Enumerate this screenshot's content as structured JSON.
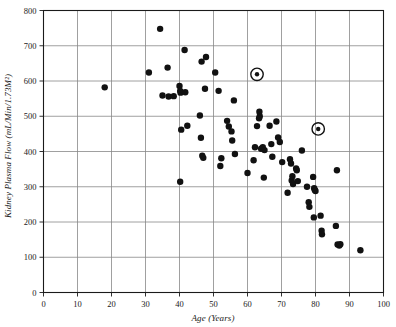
{
  "chart_data": {
    "type": "scatter",
    "title": "",
    "xlabel": "Age (Years)",
    "ylabel": "Kidney Plasma Flow (mL/Min/1.73M²)",
    "xlim": [
      0,
      100
    ],
    "ylim": [
      0,
      800
    ],
    "xticks": [
      0,
      10,
      20,
      30,
      40,
      50,
      60,
      70,
      80,
      90,
      100
    ],
    "yticks": [
      0,
      100,
      200,
      300,
      400,
      500,
      600,
      700,
      800
    ],
    "xtick_labels": [
      "0",
      "10",
      "20",
      "30",
      "40",
      "50",
      "60",
      "70",
      "80",
      "90",
      "100"
    ],
    "ytick_labels": [
      "0",
      "100",
      "200",
      "300",
      "400",
      "500",
      "600",
      "700",
      "800"
    ],
    "grid": true,
    "grid_color": "#888888",
    "legend": null,
    "marker_color": "#111111",
    "marker_size": 3.2,
    "series": [
      {
        "name": "Subjects",
        "points": [
          [
            18.0,
            582
          ],
          [
            31.0,
            624
          ],
          [
            34.3,
            748
          ],
          [
            35.0,
            559
          ],
          [
            36.5,
            638
          ],
          [
            36.8,
            556
          ],
          [
            38.3,
            557
          ],
          [
            40.0,
            586
          ],
          [
            40.2,
            572
          ],
          [
            40.3,
            567
          ],
          [
            40.5,
            462
          ],
          [
            41.5,
            688
          ],
          [
            41.7,
            568
          ],
          [
            42.3,
            473
          ],
          [
            40.2,
            314
          ],
          [
            46.0,
            502
          ],
          [
            46.3,
            439
          ],
          [
            46.5,
            655
          ],
          [
            47.8,
            668
          ],
          [
            47.5,
            578
          ],
          [
            47.0,
            382
          ],
          [
            46.7,
            388
          ],
          [
            50.5,
            624
          ],
          [
            51.5,
            572
          ],
          [
            52.0,
            359
          ],
          [
            52.3,
            381
          ],
          [
            54.0,
            487
          ],
          [
            54.5,
            471
          ],
          [
            55.3,
            457
          ],
          [
            55.5,
            431
          ],
          [
            56.3,
            393
          ],
          [
            56.0,
            545
          ],
          [
            60.0,
            339
          ],
          [
            61.8,
            375
          ],
          [
            62.2,
            412
          ],
          [
            62.8,
            472
          ],
          [
            63.5,
            513
          ],
          [
            63.6,
            500
          ],
          [
            63.4,
            494
          ],
          [
            64.0,
            408
          ],
          [
            64.5,
            412
          ],
          [
            65.0,
            404
          ],
          [
            64.8,
            326
          ],
          [
            66.5,
            473
          ],
          [
            67.0,
            421
          ],
          [
            67.3,
            385
          ],
          [
            68.5,
            485
          ],
          [
            69.0,
            440
          ],
          [
            69.5,
            427
          ],
          [
            70.2,
            370
          ],
          [
            71.8,
            283
          ],
          [
            72.5,
            378
          ],
          [
            72.8,
            366
          ],
          [
            73.0,
            318
          ],
          [
            73.2,
            330
          ],
          [
            73.4,
            308
          ],
          [
            74.3,
            352
          ],
          [
            74.5,
            347
          ],
          [
            74.8,
            316
          ],
          [
            76.0,
            403
          ],
          [
            77.5,
            300
          ],
          [
            78.0,
            256
          ],
          [
            78.2,
            243
          ],
          [
            79.3,
            328
          ],
          [
            79.5,
            213
          ],
          [
            79.6,
            296
          ],
          [
            79.8,
            291
          ],
          [
            80.0,
            288
          ],
          [
            81.5,
            218
          ],
          [
            81.8,
            175
          ],
          [
            81.9,
            165
          ],
          [
            86.3,
            347
          ],
          [
            86.0,
            189
          ],
          [
            86.5,
            136
          ],
          [
            87.0,
            133
          ],
          [
            87.3,
            137
          ],
          [
            93.2,
            120
          ]
        ]
      }
    ],
    "highlighted_points": [
      {
        "x": 62.8,
        "y": 619,
        "marker": "circled-dot"
      },
      {
        "x": 80.8,
        "y": 464,
        "marker": "circled-dot"
      }
    ]
  }
}
